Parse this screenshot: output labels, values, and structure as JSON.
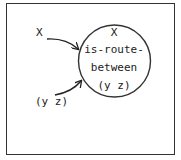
{
  "diagram": {
    "input_x_label": "X",
    "input_yz_label": "(y z)",
    "node": {
      "line1": "X",
      "line2": "is-route-",
      "line3": "between",
      "line4": "(y z)"
    }
  }
}
